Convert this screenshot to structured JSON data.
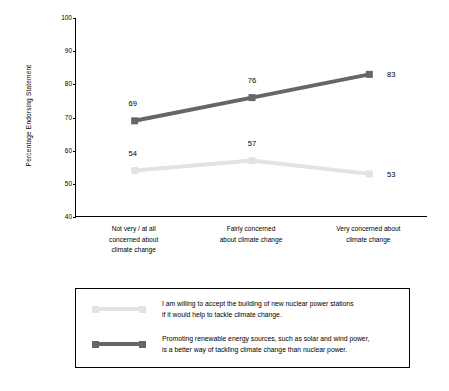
{
  "chart_data": {
    "type": "line",
    "title": "",
    "xlabel": "",
    "ylabel": "Percentage Endorsing Statement",
    "ylim": [
      40,
      100
    ],
    "yticks": [
      40,
      50,
      60,
      70,
      80,
      90,
      100
    ],
    "grid": false,
    "legend_position": "bottom",
    "categories": [
      "Not very / at all concerned about climate change",
      "Fairly concerned about climate change",
      "Very concerned about climate change"
    ],
    "category_lines": [
      [
        "Not very / at all",
        "concerned about",
        "climate change"
      ],
      [
        "Fairly concerned",
        "about climate change"
      ],
      [
        "Very concerned about",
        "climate change"
      ]
    ],
    "series": [
      {
        "name": "nuclear",
        "legend_line1": "I am willing to accept the building of new nuclear power stations",
        "legend_line2": "if it would help to tackle climate change.",
        "color": "#e3e3e3",
        "values": [
          54,
          57,
          53
        ],
        "labels": [
          "54",
          "57",
          "53"
        ]
      },
      {
        "name": "renewables",
        "legend_line1": "Promoting renewable energy sources, such as solar and wind power,",
        "legend_line2": "is a better way of tackling climate change than nuclear power.",
        "color": "#666666",
        "values": [
          69,
          76,
          83
        ],
        "labels": [
          "69",
          "76",
          "83"
        ]
      }
    ]
  },
  "axis": {
    "y_title": "Percentage Endorsing Statement",
    "y_ticklabels": [
      "100",
      "90",
      "80",
      "70",
      "60",
      "50",
      "40"
    ]
  }
}
